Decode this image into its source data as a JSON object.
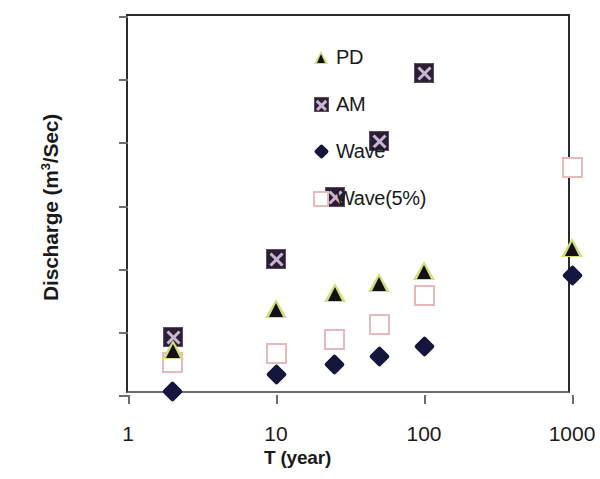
{
  "chart_data": {
    "type": "scatter",
    "title": "",
    "xlabel": "T (year)",
    "ylabel_parts": {
      "pre": "Discharge (m",
      "sup": "3",
      "post": "/Sec)"
    },
    "ylabel": "Discharge (m3/Sec)",
    "xscale": "log",
    "yscale": "linear",
    "xlim": [
      1,
      1000
    ],
    "ylim": [
      0,
      600
    ],
    "xticks": [
      "1",
      "10",
      "100",
      "1000"
    ],
    "xtick_values": [
      1,
      10,
      100,
      1000
    ],
    "yticks": [
      "0",
      "100",
      "200",
      "300",
      "400",
      "500",
      "600"
    ],
    "ytick_values": [
      0,
      100,
      200,
      300,
      400,
      500,
      600
    ],
    "grid": false,
    "legend_position": "top-left-inside",
    "series": [
      {
        "name": "PD",
        "marker": "triangle",
        "color": "#151018",
        "edge_color": "#cfe07a",
        "x": [
          2,
          10,
          25,
          50,
          100,
          1000
        ],
        "values": [
          71,
          136,
          162,
          178,
          196,
          233
        ]
      },
      {
        "name": "AM",
        "marker": "square-x",
        "color": "#2b1f33",
        "edge_color": "#c9b6d4",
        "x": [
          2,
          10,
          25,
          50,
          100
        ],
        "values": [
          92,
          216,
          313,
          402,
          510
        ]
      },
      {
        "name": "Wave",
        "marker": "diamond",
        "color": "#15153d",
        "edge_color": "#15153d",
        "x": [
          2,
          10,
          25,
          50,
          100,
          1000
        ],
        "values": [
          6,
          33,
          48,
          61,
          77,
          189
        ]
      },
      {
        "name": "Wave(5%)",
        "marker": "open-square",
        "color": "#ffffff",
        "edge_color": "#e8b9ba",
        "x": [
          2,
          10,
          25,
          50,
          100,
          1000
        ],
        "values": [
          52,
          65,
          88,
          112,
          158,
          360
        ]
      }
    ]
  },
  "legend": {
    "items": [
      {
        "label": "PD",
        "marker": "triangle"
      },
      {
        "label": "AM",
        "marker": "square-x"
      },
      {
        "label": "Wave",
        "marker": "diamond"
      },
      {
        "label": "Wave(5%)",
        "marker": "open-square"
      }
    ]
  }
}
